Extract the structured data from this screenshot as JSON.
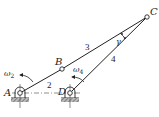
{
  "diagram": {
    "type": "four-bar linkage",
    "colors": {
      "line": "#222222",
      "ground": "#555555",
      "background": "#ffffff"
    },
    "joints": {
      "A": {
        "label": "A",
        "x": 20,
        "y": 93
      },
      "B": {
        "label": "B",
        "x": 62,
        "y": 69
      },
      "C": {
        "label": "C",
        "x": 147,
        "y": 17
      },
      "D": {
        "label": "D",
        "x": 70,
        "y": 93
      }
    },
    "links": [
      {
        "id": "2",
        "label": "2",
        "from": "A",
        "to": "B"
      },
      {
        "id": "3",
        "label": "3",
        "from": "B",
        "to": "C"
      },
      {
        "id": "4",
        "label": "4",
        "from": "D",
        "to": "C"
      }
    ],
    "angular_velocities": [
      {
        "label": "ω",
        "sub": "2",
        "link": "2"
      },
      {
        "label": "ω",
        "sub": "4",
        "link": "4"
      }
    ],
    "angle": {
      "label": "γ",
      "at": "C",
      "between": [
        "3",
        "4"
      ]
    }
  }
}
